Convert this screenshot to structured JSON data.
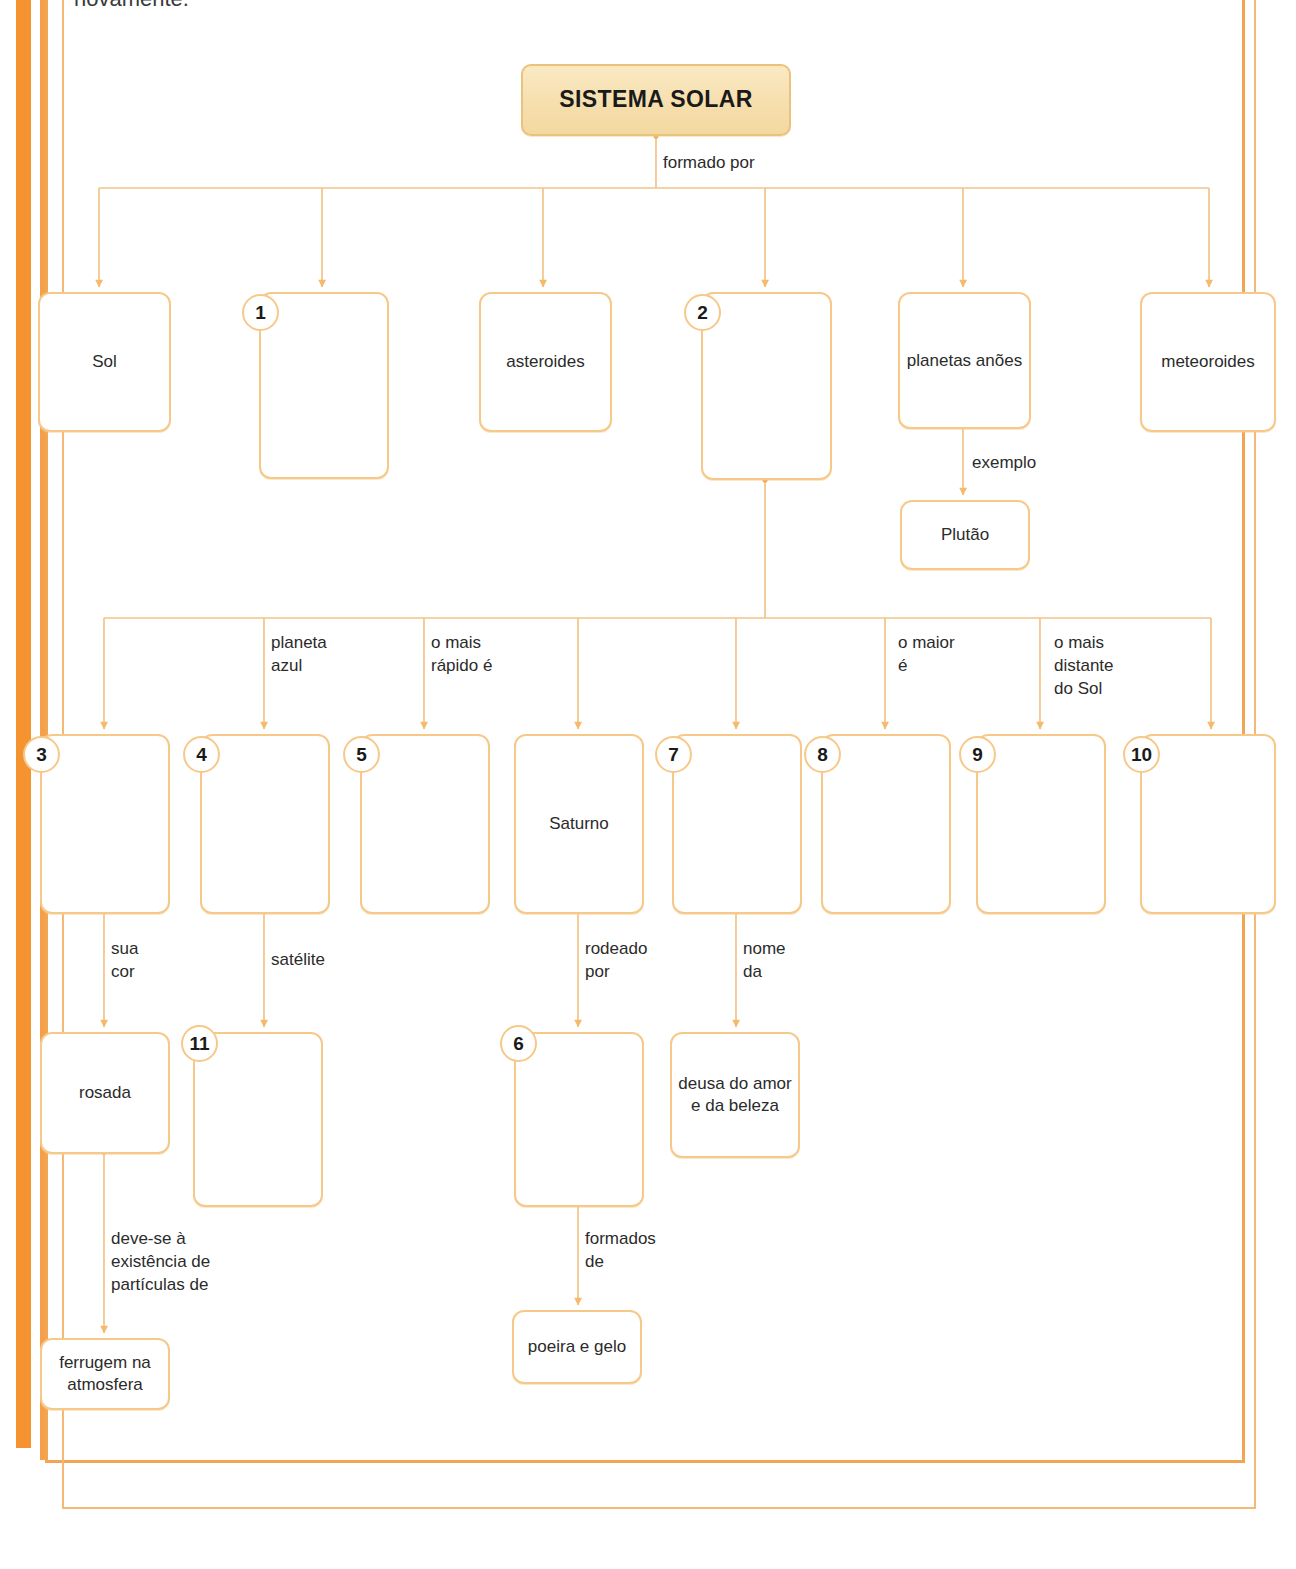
{
  "page": {
    "cut_off_text": "novamente.",
    "accent_color": "#f4932f",
    "box_border_color": "#f6c98a",
    "title_fill_color": "#f6dfae"
  },
  "diagram": {
    "type": "concept-map",
    "language": "pt-BR",
    "title": "SISTEMA SOLAR",
    "root_label": "formado por",
    "nodes": [
      {
        "id": "root",
        "text": "SISTEMA SOLAR",
        "badge": null
      },
      {
        "id": "sol",
        "text": "Sol",
        "badge": null
      },
      {
        "id": "n1",
        "text": "",
        "badge": "1"
      },
      {
        "id": "asteroides",
        "text": "asteroides",
        "badge": null
      },
      {
        "id": "n2",
        "text": "",
        "badge": "2"
      },
      {
        "id": "planetas",
        "text": "planetas\nanões",
        "badge": null
      },
      {
        "id": "meteoroides",
        "text": "meteoroides",
        "badge": null
      },
      {
        "id": "plutao",
        "text": "Plutão",
        "badge": null
      },
      {
        "id": "n3",
        "text": "",
        "badge": "3"
      },
      {
        "id": "n4",
        "text": "",
        "badge": "4"
      },
      {
        "id": "n5",
        "text": "",
        "badge": "5"
      },
      {
        "id": "saturno",
        "text": "Saturno",
        "badge": null
      },
      {
        "id": "n7",
        "text": "",
        "badge": "7"
      },
      {
        "id": "n8",
        "text": "",
        "badge": "8"
      },
      {
        "id": "n9",
        "text": "",
        "badge": "9"
      },
      {
        "id": "n10",
        "text": "",
        "badge": "10"
      },
      {
        "id": "rosada",
        "text": "rosada",
        "badge": null
      },
      {
        "id": "n11",
        "text": "",
        "badge": "11"
      },
      {
        "id": "n6",
        "text": "",
        "badge": "6"
      },
      {
        "id": "deusa",
        "text": "deusa do\namor e da\nbeleza",
        "badge": null
      },
      {
        "id": "ferrugem",
        "text": "ferrugem na\natmosfera",
        "badge": null
      },
      {
        "id": "poeira",
        "text": "poeira\ne gelo",
        "badge": null
      }
    ],
    "edge_labels": [
      {
        "id": "formado-por",
        "text": "formado por"
      },
      {
        "id": "exemplo",
        "text": "exemplo"
      },
      {
        "id": "planeta-azul",
        "text": "planeta\nazul"
      },
      {
        "id": "mais-rapido",
        "text": "o mais\nrápido é"
      },
      {
        "id": "o-maior",
        "text": "o maior\né"
      },
      {
        "id": "mais-distante",
        "text": "o mais\ndistante\ndo Sol"
      },
      {
        "id": "sua-cor",
        "text": "sua\ncor"
      },
      {
        "id": "satelite",
        "text": "satélite"
      },
      {
        "id": "rodeado-por",
        "text": "rodeado\npor"
      },
      {
        "id": "nome-da",
        "text": "nome\nda"
      },
      {
        "id": "deve-se",
        "text": "deve-se à\nexistência de\npartículas de"
      },
      {
        "id": "formados-de",
        "text": "formados\nde"
      }
    ]
  }
}
